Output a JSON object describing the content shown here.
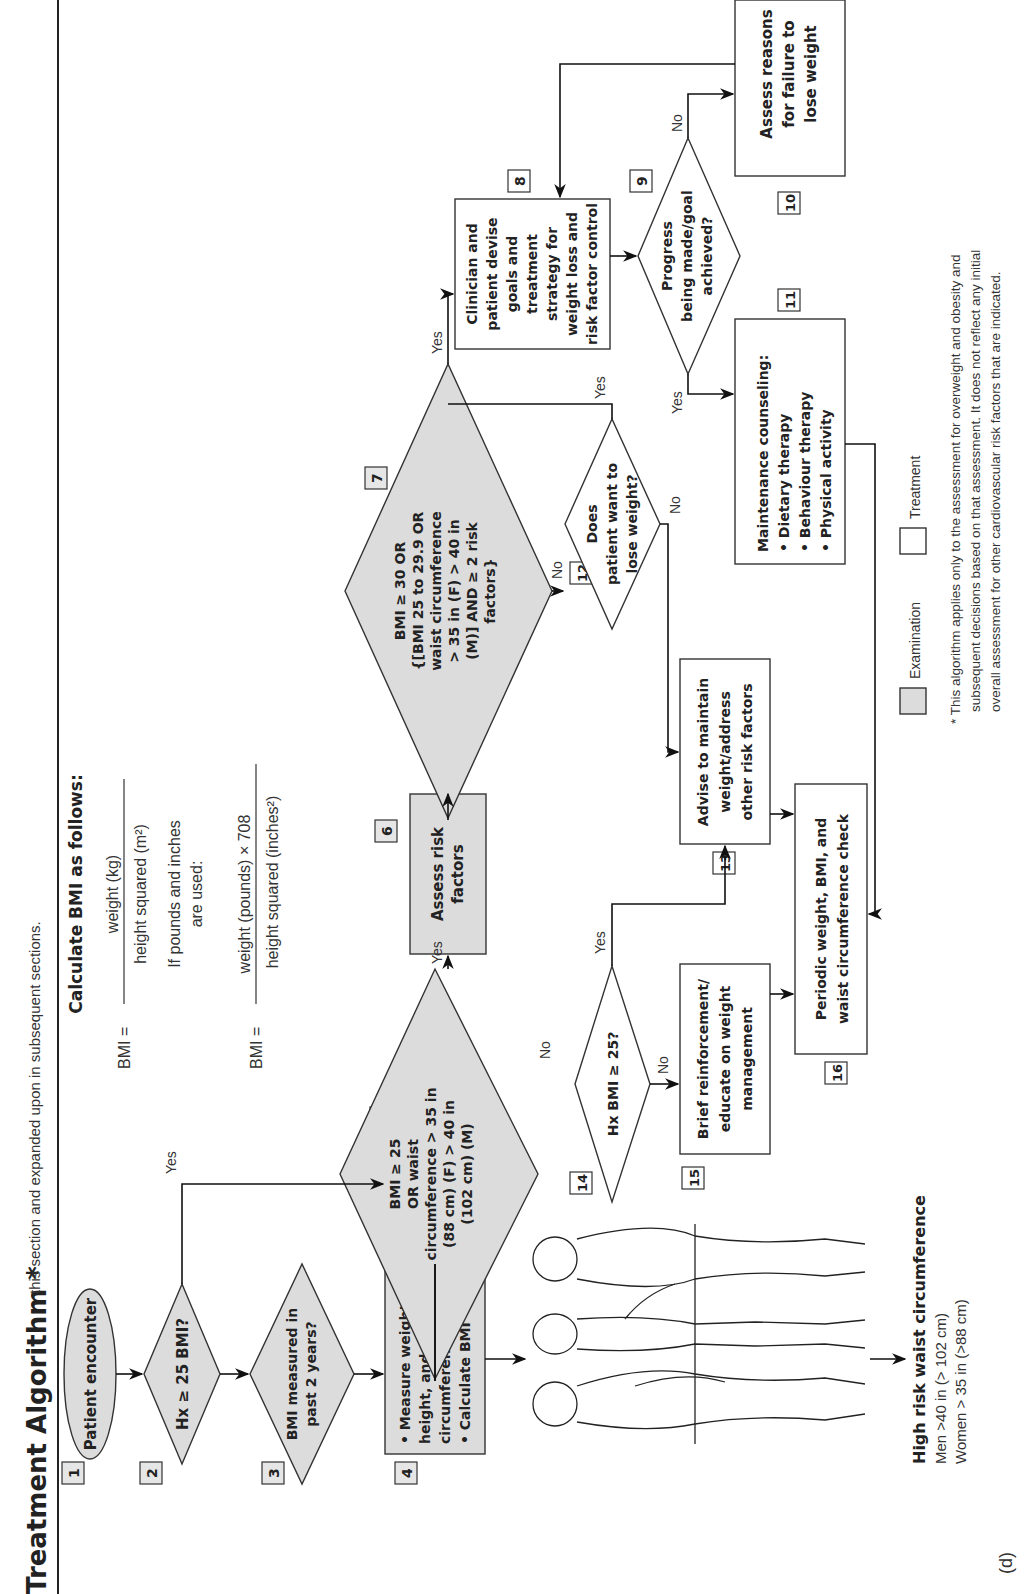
{
  "header": {
    "title": "Treatment Algorithm *",
    "subtitle": "this section and expanded upon in subsequent sections."
  },
  "bmi_formula": {
    "heading": "Calculate BMI as follows:",
    "lhs": "BMI =",
    "metric_numerator": "weight (kg)",
    "metric_denominator": "height squared (m²)",
    "imperial_note_line1": "If pounds and inches",
    "imperial_note_line2": "are used:",
    "imperial_numerator": "weight (pounds) × 708",
    "imperial_denominator": "height squared (inches²)"
  },
  "nodes": [
    {
      "id": "1",
      "type": "terminal",
      "category": "examination",
      "lines": [
        "Patient encounter"
      ]
    },
    {
      "id": "2",
      "type": "decision",
      "category": "examination",
      "lines": [
        "Hx ≥ 25 BMI?"
      ]
    },
    {
      "id": "3",
      "type": "decision",
      "category": "examination",
      "lines": [
        "BMI measured in",
        "past 2 years?"
      ]
    },
    {
      "id": "4",
      "type": "process",
      "category": "examination",
      "lines": [
        "• Measure weight,",
        "   height, and waist",
        "   circumference",
        "• Calculate BMI"
      ]
    },
    {
      "id": "5",
      "type": "decision",
      "category": "examination",
      "lines": [
        "BMI ≥ 25",
        "OR waist",
        "circumference > 35 in",
        "(88 cm) (F) > 40 in",
        "(102 cm) (M)"
      ]
    },
    {
      "id": "6",
      "type": "process",
      "category": "examination",
      "lines": [
        "Assess risk",
        "factors"
      ]
    },
    {
      "id": "7",
      "type": "decision",
      "category": "examination",
      "lines": [
        "BMI ≥ 30 OR",
        "{[BMI 25 to 29.9 OR",
        "waist circumference",
        "> 35 in (F) > 40 in",
        "(M)] AND ≥ 2 risk",
        "factors}"
      ]
    },
    {
      "id": "8",
      "type": "process",
      "category": "treatment",
      "lines": [
        "Clinician and",
        "patient devise",
        "goals and",
        "treatment",
        "strategy for",
        "weight loss and",
        "risk factor control"
      ]
    },
    {
      "id": "9",
      "type": "decision",
      "category": "treatment",
      "lines": [
        "Progress",
        "being made/goal",
        "achieved?"
      ]
    },
    {
      "id": "10",
      "type": "process",
      "category": "treatment",
      "lines": [
        "Assess reasons",
        "for failure to",
        "lose weight"
      ]
    },
    {
      "id": "11",
      "type": "process",
      "category": "treatment",
      "lines": [
        "Maintenance counseling:",
        "• Dietary therapy",
        "• Behaviour therapy",
        "• Physical activity"
      ]
    },
    {
      "id": "12",
      "type": "decision",
      "category": "treatment",
      "lines": [
        "Does",
        "patient want to",
        "lose weight?"
      ]
    },
    {
      "id": "13",
      "type": "process",
      "category": "treatment",
      "lines": [
        "Advise to maintain",
        "weight/address",
        "other risk factors"
      ]
    },
    {
      "id": "14",
      "type": "decision",
      "category": "treatment",
      "lines": [
        "Hx BMI ≥ 25?"
      ]
    },
    {
      "id": "15",
      "type": "process",
      "category": "treatment",
      "lines": [
        "Brief reinforcement/",
        "educate on weight",
        "management"
      ]
    },
    {
      "id": "16",
      "type": "process",
      "category": "treatment",
      "lines": [
        "Periodic weight, BMI, and",
        "waist circumference check"
      ]
    }
  ],
  "edge_labels": {
    "yes": "Yes",
    "no": "No"
  },
  "edges": [
    {
      "from": "1",
      "to": "2"
    },
    {
      "from": "2",
      "to": "3"
    },
    {
      "from": "2",
      "to": "4",
      "label": "Yes"
    },
    {
      "from": "3",
      "to": "4"
    },
    {
      "from": "4",
      "to": "5"
    },
    {
      "from": "5",
      "to": "6",
      "label": "Yes"
    },
    {
      "from": "5",
      "to": "14",
      "label": "No"
    },
    {
      "from": "6",
      "to": "7"
    },
    {
      "from": "7",
      "to": "8",
      "label": "Yes"
    },
    {
      "from": "7",
      "to": "12",
      "label": "No"
    },
    {
      "from": "12",
      "to": "8",
      "label": "Yes"
    },
    {
      "from": "12",
      "to": "13",
      "label": "No"
    },
    {
      "from": "8",
      "to": "9"
    },
    {
      "from": "9",
      "to": "10",
      "label": "No"
    },
    {
      "from": "9",
      "to": "11",
      "label": "Yes"
    },
    {
      "from": "10",
      "to": "8"
    },
    {
      "from": "11",
      "to": "16"
    },
    {
      "from": "14",
      "to": "13",
      "label": "Yes"
    },
    {
      "from": "14",
      "to": "15",
      "label": "No"
    },
    {
      "from": "13",
      "to": "16"
    },
    {
      "from": "15",
      "to": "16"
    }
  ],
  "waist": {
    "heading": "High risk waist circumference",
    "men": "Men >40 in (> 102 cm)",
    "women": "Women > 35 in (>88 cm)"
  },
  "legend": {
    "examination": "Examination",
    "treatment": "Treatment"
  },
  "footnote": {
    "line1": "* This algorithm applies only to the assessment for overweight and obesity and",
    "line2": "subsequent decisions based on that assessment. It does not reflect any initial",
    "line3": "overall assessment for other cardiovascular risk factors that are indicated."
  },
  "panel_label": "(d)",
  "colors": {
    "examination_fill": "#dcdcdc",
    "treatment_fill": "#ffffff",
    "stroke": "#333333"
  }
}
